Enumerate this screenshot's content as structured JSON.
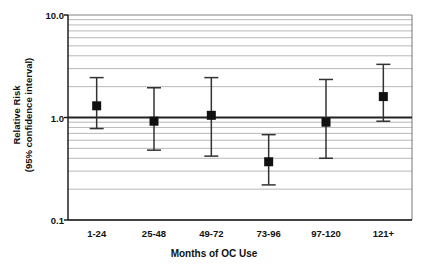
{
  "chart_data": {
    "type": "scatter",
    "subtype": "forest-plot-error-bars",
    "title": "",
    "xlabel": "Months of OC Use",
    "ylabel_line1": "Relative Risk",
    "ylabel_line2": "(95% confidence interval)",
    "categories": [
      "1-24",
      "25-48",
      "49-72",
      "73-96",
      "97-120",
      "121+"
    ],
    "yscale": "log",
    "ylim": [
      0.1,
      10.0
    ],
    "ytick_labels": [
      "10.0",
      "1.0",
      "0.1"
    ],
    "ytick_values": [
      10.0,
      1.0,
      0.1
    ],
    "grid": "horizontal-minor-log",
    "reference_line": 1.0,
    "legend": "none",
    "values": [
      1.3,
      0.92,
      1.05,
      0.37,
      0.9,
      1.6
    ],
    "ci_lower": [
      0.78,
      0.48,
      0.42,
      0.22,
      0.4,
      0.92
    ],
    "ci_upper": [
      2.45,
      1.95,
      2.45,
      0.68,
      2.35,
      3.3
    ],
    "series": [
      {
        "name": "Relative Risk",
        "points": [
          {
            "category": "1-24",
            "value": 1.3,
            "ci_lower": 0.78,
            "ci_upper": 2.45
          },
          {
            "category": "25-48",
            "value": 0.92,
            "ci_lower": 0.48,
            "ci_upper": 1.95
          },
          {
            "category": "49-72",
            "value": 1.05,
            "ci_lower": 0.42,
            "ci_upper": 2.45
          },
          {
            "category": "73-96",
            "value": 0.37,
            "ci_lower": 0.22,
            "ci_upper": 0.68
          },
          {
            "category": "97-120",
            "value": 0.9,
            "ci_lower": 0.4,
            "ci_upper": 2.35
          },
          {
            "category": "121+",
            "value": 1.6,
            "ci_lower": 0.92,
            "ci_upper": 3.3
          }
        ]
      }
    ],
    "colors": {
      "marker": "#111111",
      "error_bar": "#333333",
      "grid": "#9a9a9a",
      "axis": "#111111",
      "reference_line": "#222222",
      "background": "#ffffff"
    }
  }
}
